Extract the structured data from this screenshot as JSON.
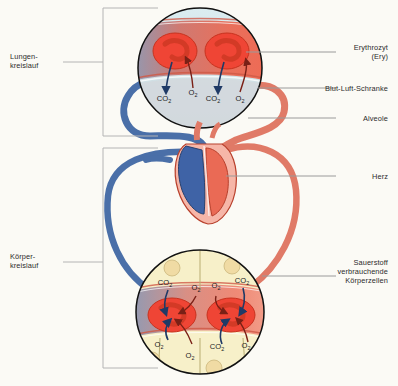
{
  "diagram": {
    "background": "#fbfaf5",
    "colors": {
      "vein_blue": "#4a6fa8",
      "artery_red": "#e07a67",
      "erythrocyte_red": "#ef4535",
      "alveolus_air": "#d8e8ec",
      "bodycell_yellow": "#f7f0c9",
      "leader_gray": "#9a9a9a",
      "bracket_gray": "#b4b4b4",
      "text_dark": "#2b2b2b"
    }
  },
  "labels": {
    "left": [
      {
        "id": "lungenkreislauf",
        "text": "Lungen-\nkreislauf"
      },
      {
        "id": "koerperkreislauf",
        "text": "Körper-\nkreislauf"
      }
    ],
    "right": [
      {
        "id": "erythrozyt",
        "text": "Erythrozyt\n(Ery)"
      },
      {
        "id": "blut-luft-schranke",
        "text": "Blut-Luft-Schranke"
      },
      {
        "id": "alveole",
        "text": "Alveole"
      },
      {
        "id": "herz",
        "text": "Herz"
      },
      {
        "id": "koerperzellen",
        "text": "Sauerstoff\nverbrauchende\nKörperzellen"
      }
    ]
  },
  "gases": {
    "lung": [
      {
        "id": "lung-co2-left",
        "species": "CO",
        "sub": "2",
        "x": 164,
        "y": 101
      },
      {
        "id": "lung-o2-left",
        "species": "O",
        "sub": "2",
        "x": 193,
        "y": 95
      },
      {
        "id": "lung-co2-right",
        "species": "CO",
        "sub": "2",
        "x": 211,
        "y": 101
      },
      {
        "id": "lung-o2-right",
        "species": "O",
        "sub": "2",
        "x": 240,
        "y": 101
      }
    ],
    "body_top": [
      {
        "id": "body-co2-top-left",
        "species": "CO",
        "sub": "2",
        "x": 165,
        "y": 285
      },
      {
        "id": "body-o2-top-left",
        "species": "O",
        "sub": "2",
        "x": 196,
        "y": 290
      },
      {
        "id": "body-o2-top-right",
        "species": "O",
        "sub": "2",
        "x": 216,
        "y": 288
      },
      {
        "id": "body-co2-top-right",
        "species": "CO",
        "sub": "2",
        "x": 240,
        "y": 283
      }
    ],
    "body_bottom": [
      {
        "id": "body-o2-bot-left",
        "species": "O",
        "sub": "2",
        "x": 159,
        "y": 347
      },
      {
        "id": "body-o2-bot-mid",
        "species": "O",
        "sub": "2",
        "x": 190,
        "y": 357
      },
      {
        "id": "body-co2-bot-right",
        "species": "CO",
        "sub": "2",
        "x": 215,
        "y": 349
      },
      {
        "id": "body-o2-bot-far",
        "species": "O",
        "sub": "2",
        "x": 245,
        "y": 348
      }
    ]
  },
  "structures": {
    "alveolus": "Alveole mit Kapillarnetz und Erythrozyten",
    "heart": "Herz mit rechter (blau) und linker (rot) Hälfte",
    "body_cells": "Sauerstoff verbrauchende Körperzellen"
  }
}
